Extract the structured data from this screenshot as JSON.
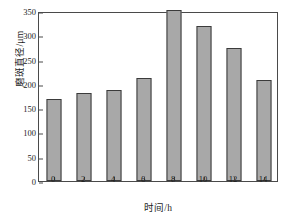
{
  "chart_data": {
    "type": "bar",
    "title": "",
    "xlabel": "时间/h",
    "ylabel": "磨斑直径/μm",
    "categories": [
      "0",
      "2",
      "4",
      "6",
      "8",
      "10",
      "12",
      "14"
    ],
    "values": [
      168,
      181,
      187,
      212,
      352,
      320,
      274,
      208
    ],
    "ylim": [
      0,
      350
    ],
    "yticks": [
      0,
      50,
      100,
      150,
      200,
      250,
      300,
      350
    ],
    "ytick_labels": [
      "0",
      "50",
      "100",
      "150",
      "200",
      "250",
      "300",
      "350"
    ],
    "xtick_labels": [
      "0",
      "2",
      "4",
      "6",
      "8",
      "10",
      "12",
      "14"
    ],
    "grid": false,
    "legend": false,
    "legend_position": "none",
    "bar_fill_color": "#a8a8a8",
    "bar_edge_color": "#3b3b3b",
    "axis_color": "#4a4a4a",
    "background_color": "#ffffff"
  }
}
